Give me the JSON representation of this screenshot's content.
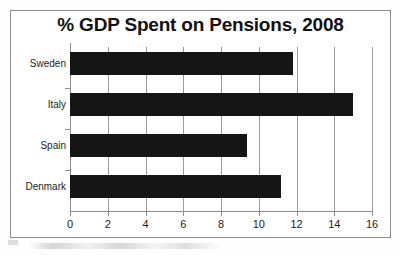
{
  "figure": {
    "title": "% GDP Spent on Pensions, 2008",
    "frame_color": "#8d8d8d",
    "bar_color": "#151515",
    "grid_color": "#9a9a9a",
    "background": "#ffffff"
  },
  "chart_data": {
    "type": "bar",
    "orientation": "horizontal",
    "title": "% GDP Spent on Pensions, 2008",
    "xlabel": "",
    "ylabel": "",
    "categories": [
      "Sweden",
      "Italy",
      "Spain",
      "Denmark"
    ],
    "values": [
      11.8,
      15.0,
      9.4,
      11.2
    ],
    "series": [
      {
        "name": "% GDP Spent on Pensions",
        "values": [
          11.8,
          15.0,
          9.4,
          11.2
        ]
      }
    ],
    "xlim": [
      0,
      16
    ],
    "xticks": [
      0,
      2,
      4,
      6,
      8,
      10,
      12,
      14,
      16
    ],
    "xtick_labels": [
      "0",
      "2",
      "4",
      "6",
      "8",
      "10",
      "12",
      "14",
      "16"
    ],
    "grid": true,
    "grid_axis": "x",
    "legend": false,
    "legend_position": "none"
  }
}
